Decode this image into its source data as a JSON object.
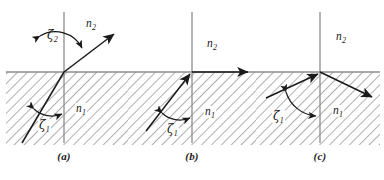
{
  "figure": {
    "panel_count": 3,
    "colors": {
      "ink": "#1a1a1a",
      "hatch": "#9a9a9a",
      "normal_line": "#8c8c8c",
      "interface_line": "#8c8c8c",
      "background": "#ffffff"
    }
  },
  "panels": [
    {
      "id": "a",
      "caption": "(a)",
      "description": "Incident ray in medium n1 refracts into medium n2 away from the normal",
      "labels": {
        "upper_medium": "n",
        "upper_medium_sub": "2",
        "lower_medium": "n",
        "lower_medium_sub": "1",
        "angle_incidence": "ζ",
        "angle_incidence_sub": "1",
        "angle_refraction": "ζ",
        "angle_refraction_sub": "2"
      },
      "rays": [
        {
          "name": "incident-ray",
          "from": [
            22,
            143
          ],
          "to": [
            64,
            72
          ],
          "arrow": "none"
        },
        {
          "name": "refracted-ray",
          "from": [
            64,
            72
          ],
          "to": [
            116,
            33
          ],
          "arrow": "end"
        }
      ],
      "angle_arcs": [
        {
          "name": "incidence-arc",
          "value_label": "ζ₁"
        },
        {
          "name": "refraction-arc",
          "value_label": "ζ₂"
        }
      ]
    },
    {
      "id": "b",
      "caption": "(b)",
      "description": "Critical angle: refracted ray grazes along the interface",
      "labels": {
        "upper_medium": "n",
        "upper_medium_sub": "2",
        "lower_medium": "n",
        "lower_medium_sub": "1",
        "angle_incidence": "ζ",
        "angle_incidence_sub": "1"
      },
      "rays": [
        {
          "name": "incident-ray",
          "from": [
            18,
            131
          ],
          "to": [
            64,
            72
          ],
          "arrow": "end"
        },
        {
          "name": "grazing-ray",
          "from": [
            64,
            72
          ],
          "to": [
            122,
            72
          ],
          "arrow": "end"
        }
      ],
      "angle_arcs": [
        {
          "name": "incidence-arc",
          "value_label": "ζ₁"
        }
      ]
    },
    {
      "id": "c",
      "caption": "(c)",
      "description": "Total internal reflection: ray reflects back into medium n1",
      "labels": {
        "upper_medium": "n",
        "upper_medium_sub": "2",
        "lower_medium": "n",
        "lower_medium_sub": "1",
        "angle_incidence": "ζ",
        "angle_incidence_sub": "1"
      },
      "rays": [
        {
          "name": "incident-ray",
          "from": [
            12,
            98
          ],
          "to": [
            64,
            72
          ],
          "arrow": "end"
        },
        {
          "name": "reflected-ray",
          "from": [
            64,
            72
          ],
          "to": [
            118,
            98
          ],
          "arrow": "end"
        }
      ],
      "angle_arcs": [
        {
          "name": "incidence-arc",
          "value_label": "ζ₁"
        }
      ]
    }
  ]
}
